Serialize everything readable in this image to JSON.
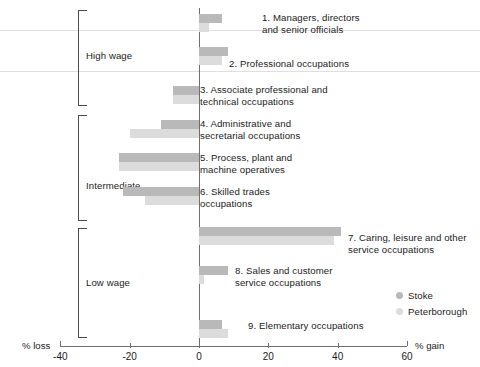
{
  "chart_data": {
    "type": "bar",
    "orientation": "horizontal",
    "title": "",
    "subtitle": "",
    "xlabel": "",
    "ylabel": "",
    "xlim": [
      -40,
      60
    ],
    "grid": false,
    "legend_position": "right-inside-lower",
    "axis_caption_left": "% loss",
    "axis_caption_right": "% gain",
    "tick_labels": [
      "-40",
      "-20",
      "0",
      "20",
      "40",
      "60"
    ],
    "tick_values": [
      -40,
      -20,
      0,
      20,
      40,
      60
    ],
    "categories": [
      "1. Managers, directors\nand senior officials",
      "2. Professional occupations",
      "3. Associate professional and\ntechnical occupations",
      "4. Administrative and\nsecretarial occupations",
      "5. Process, plant and\nmachine operatives",
      "6. Skilled trades\noccupations",
      "7. Caring, leisure and other\nservice occupations",
      "8. Sales and customer\nservice occupations",
      "9. Elementary occupations"
    ],
    "series": [
      {
        "name": "Stoke",
        "color": "#b9b9b9",
        "values": [
          6.5,
          8.5,
          -7.5,
          -11.0,
          -23.0,
          -22.0,
          41.0,
          8.5,
          6.5
        ]
      },
      {
        "name": "Peterborough",
        "color": "#dcdcdc",
        "values": [
          3.0,
          6.5,
          -7.5,
          -20.0,
          -23.0,
          -15.5,
          39.0,
          1.5,
          8.5
        ]
      }
    ],
    "groups": [
      {
        "label": "High wage",
        "rows": [
          0,
          1,
          2
        ]
      },
      {
        "label": "Intermediate",
        "rows": [
          3,
          4,
          5
        ]
      },
      {
        "label": "Low wage",
        "rows": [
          6,
          7,
          8
        ]
      }
    ]
  },
  "legend": {
    "items": [
      {
        "label": "Stoke",
        "color": "#b9b9b9"
      },
      {
        "label": "Peterborough",
        "color": "#dcdcdc"
      }
    ]
  },
  "axis": {
    "left_caption": "% loss",
    "right_caption": "% gain",
    "ticks": [
      "-40",
      "-20",
      "0",
      "20",
      "40",
      "60"
    ]
  },
  "groups": {
    "high": "High wage",
    "intermediate": "Intermediate",
    "low": "Low wage"
  },
  "occupations": {
    "o1": "1. Managers, directors\nand senior officials",
    "o2": "2. Professional occupations",
    "o3": "3. Associate professional and\ntechnical occupations",
    "o4": "4. Administrative and\nsecretarial occupations",
    "o5": "5. Process, plant and\nmachine operatives",
    "o6": "6. Skilled trades\noccupations",
    "o7": "7. Caring, leisure and other\nservice occupations",
    "o8": "8. Sales and customer\nservice occupations",
    "o9": "9. Elementary occupations"
  }
}
